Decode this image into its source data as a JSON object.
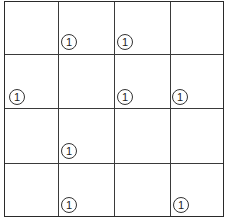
{
  "puzzle": {
    "rows": 4,
    "cols": 4,
    "clues": [
      {
        "row": 0,
        "col": 1,
        "value": "1",
        "x": 61,
        "y": 34
      },
      {
        "row": 0,
        "col": 2,
        "value": "1",
        "x": 117,
        "y": 34
      },
      {
        "row": 1,
        "col": 0,
        "value": "1",
        "x": 9,
        "y": 89
      },
      {
        "row": 1,
        "col": 2,
        "value": "1",
        "x": 117,
        "y": 89
      },
      {
        "row": 1,
        "col": 3,
        "value": "1",
        "x": 172,
        "y": 89
      },
      {
        "row": 2,
        "col": 1,
        "value": "1",
        "x": 61,
        "y": 143
      },
      {
        "row": 3,
        "col": 1,
        "value": "1",
        "x": 61,
        "y": 197
      },
      {
        "row": 3,
        "col": 3,
        "value": "1",
        "x": 173,
        "y": 197
      }
    ]
  }
}
